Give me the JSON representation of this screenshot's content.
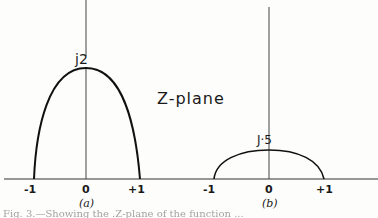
{
  "diagram": {
    "title": "Z-plane",
    "panel_a": {
      "label": "(a)",
      "peak_label": "j2",
      "ticks": [
        "-1",
        "0",
        "+1"
      ]
    },
    "panel_b": {
      "label": "(b)",
      "peak_label": "J·5",
      "ticks": [
        "-1",
        "0",
        "+1"
      ]
    },
    "caption": "Fig. 3.—Showing the .Z-plane of the function ..."
  }
}
